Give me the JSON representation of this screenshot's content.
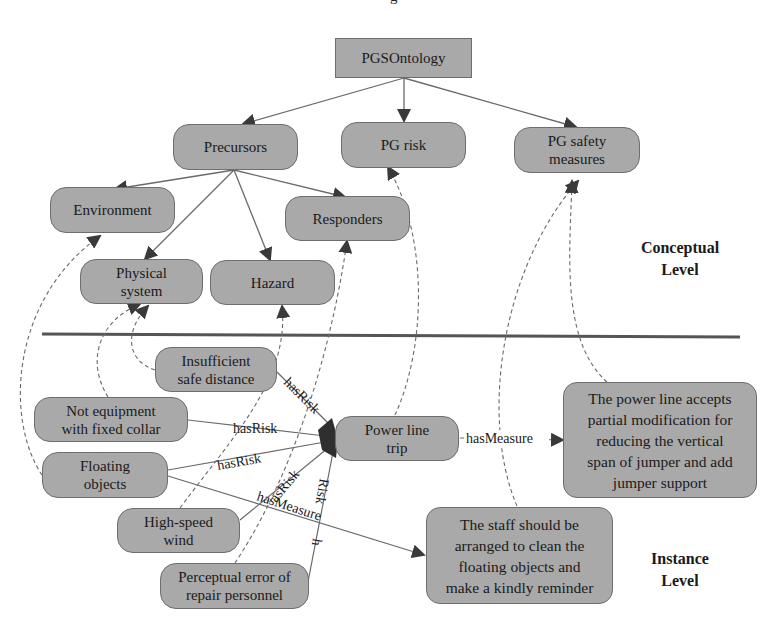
{
  "title_fragment": "g",
  "levels": {
    "conceptual": "Conceptual Level",
    "conceptual_line1": "Conceptual",
    "conceptual_line2": "Level",
    "instance_line1": "Instance",
    "instance_line2": "Level"
  },
  "colors": {
    "node_fill": "#a9a9a9",
    "node_border": "#6e6e6e",
    "edge": "#6a6a6a",
    "arrowhead": "#3a3a3a",
    "separator": "#555555"
  },
  "conceptual_nodes": {
    "root": "PGSOntology",
    "precursors": "Precursors",
    "pg_risk": "PG risk",
    "pg_safety_measures_l1": "PG safety",
    "pg_safety_measures_l2": "measures",
    "environment": "Environment",
    "responders": "Responders",
    "physical_system_l1": "Physical",
    "physical_system_l2": "system",
    "hazard": "Hazard"
  },
  "instance_nodes": {
    "insufficient_l1": "Insufficient",
    "insufficient_l2": "safe distance",
    "not_equipment_l1": "Not equipment",
    "not_equipment_l2": "with fixed collar",
    "floating_l1": "Floating",
    "floating_l2": "objects",
    "high_speed_l1": "High-speed",
    "high_speed_l2": "wind",
    "perceptual_l1": "Perceptual error of",
    "perceptual_l2": "repair personnel",
    "power_line_trip_l1": "Power line",
    "power_line_trip_l2": "trip",
    "measure1_l1": "The power line accepts",
    "measure1_l2": "partial modification for",
    "measure1_l3": "reducing the vertical",
    "measure1_l4": "span of jumper and add",
    "measure1_l5": "jumper support",
    "measure2_l1": "The staff should be",
    "measure2_l2": "arranged to clean the",
    "measure2_l3": "floating objects and",
    "measure2_l4": "make a kindly reminder"
  },
  "edge_labels": {
    "has_risk_1": "hasRisk",
    "has_risk_2": "hasRisk",
    "has_risk_3": "hasRisk",
    "has_risk_4": "asRisk",
    "has_risk_5": "h",
    "has_risk_5b": "Risk",
    "has_measure_1": "hasMeasure",
    "has_measure_2": "hasMeasure"
  }
}
